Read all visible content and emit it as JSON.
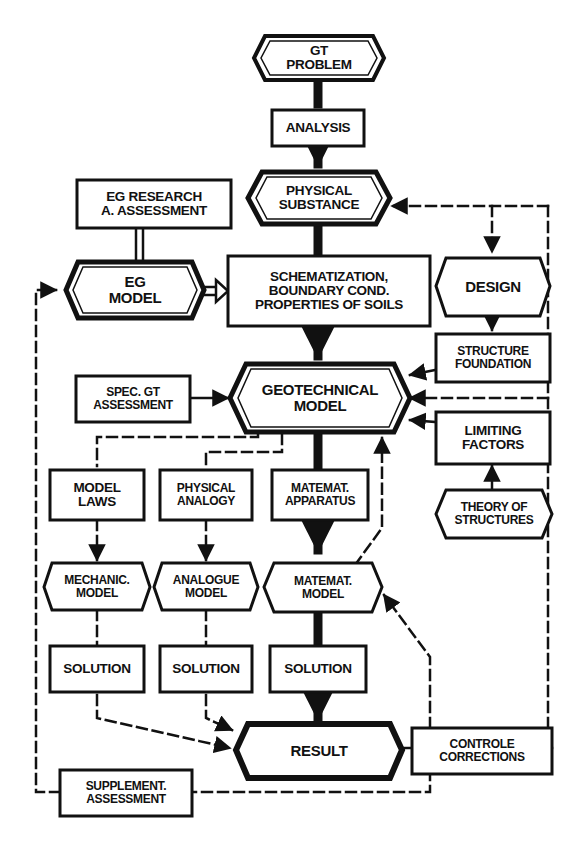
{
  "diagram": {
    "type": "flowchart",
    "colors": {
      "ink": "#111111",
      "background": "#ffffff"
    },
    "nodes": {
      "gt_problem": "GT\nPROBLEM",
      "analysis": "ANALYSIS",
      "physical_substance": "PHYSICAL\nSUBSTANCE",
      "eg_research": "EG RESEARCH\nA. ASSESSMENT",
      "eg_model": "EG\nMODEL",
      "schematization": "SCHEMATIZATION,\nBOUNDARY COND.\nPROPERTIES OF SOILS",
      "design": "DESIGN",
      "structure_foundation": "STRUCTURE\nFOUNDATION",
      "spec_gt_assessment": "SPEC. GT\nASSESSMENT",
      "geotechnical_model": "GEOTECHNICAL\nMODEL",
      "limiting_factors": "LIMITING\nFACTORS",
      "theory_of_structures": "THEORY OF\nSTRUCTURES",
      "model_laws": "MODEL\nLAWS",
      "physical_analogy": "PHYSICAL\nANALOGY",
      "matemat_apparatus": "MATEMAT.\nAPPARATUS",
      "mechanic_model": "MECHANIC.\nMODEL",
      "analogue_model": "ANALOGUE\nMODEL",
      "matemat_model": "MATEMAT.\nMODEL",
      "solution_1": "SOLUTION",
      "solution_2": "SOLUTION",
      "solution_3": "SOLUTION",
      "result": "RESULT",
      "controle_corrections": "CONTROLE\nCORRECTIONS",
      "supplement_assessment": "SUPPLEMENT.\nASSESSMENT"
    },
    "edges": [
      {
        "from": "gt_problem",
        "to": "analysis",
        "style": "bold"
      },
      {
        "from": "analysis",
        "to": "physical_substance",
        "style": "bold"
      },
      {
        "from": "physical_substance",
        "to": "schematization",
        "style": "bold"
      },
      {
        "from": "schematization",
        "to": "geotechnical_model",
        "style": "bold"
      },
      {
        "from": "eg_research",
        "to": "eg_model",
        "style": "double"
      },
      {
        "from": "eg_model",
        "to": "schematization",
        "style": "double-arrow"
      },
      {
        "from": "physical_substance",
        "to": "design",
        "style": "dashed"
      },
      {
        "from": "design",
        "to": "structure_foundation",
        "style": "solid"
      },
      {
        "from": "structure_foundation",
        "to": "geotechnical_model",
        "style": "solid"
      },
      {
        "from": "spec_gt_assessment",
        "to": "geotechnical_model",
        "style": "solid"
      },
      {
        "from": "theory_of_structures",
        "to": "limiting_factors",
        "style": "solid"
      },
      {
        "from": "limiting_factors",
        "to": "geotechnical_model",
        "style": "solid"
      },
      {
        "from": "geotechnical_model",
        "to": "model_laws",
        "style": "dashed"
      },
      {
        "from": "geotechnical_model",
        "to": "physical_analogy",
        "style": "dashed"
      },
      {
        "from": "geotechnical_model",
        "to": "matemat_apparatus",
        "style": "bold"
      },
      {
        "from": "model_laws",
        "to": "mechanic_model",
        "style": "dashed"
      },
      {
        "from": "physical_analogy",
        "to": "analogue_model",
        "style": "dashed"
      },
      {
        "from": "matemat_apparatus",
        "to": "matemat_model",
        "style": "bold"
      },
      {
        "from": "matemat_model",
        "to": "geotechnical_model",
        "style": "dashed"
      },
      {
        "from": "mechanic_model",
        "to": "solution_1",
        "style": "dashed"
      },
      {
        "from": "analogue_model",
        "to": "solution_2",
        "style": "dashed"
      },
      {
        "from": "matemat_model",
        "to": "solution_3",
        "style": "bold"
      },
      {
        "from": "solution_1",
        "to": "result",
        "style": "dashed"
      },
      {
        "from": "solution_2",
        "to": "result",
        "style": "dashed"
      },
      {
        "from": "solution_3",
        "to": "result",
        "style": "bold"
      },
      {
        "from": "result",
        "to": "controle_corrections",
        "style": "solid"
      },
      {
        "from": "controle_corrections",
        "to": "matemat_model",
        "style": "dashed"
      },
      {
        "from": "controle_corrections",
        "to": "physical_substance",
        "style": "dashed"
      },
      {
        "from": "controle_corrections",
        "to": "geotechnical_model",
        "style": "dashed"
      },
      {
        "from": "supplement_assessment",
        "to": "eg_model",
        "style": "dashed"
      }
    ]
  }
}
